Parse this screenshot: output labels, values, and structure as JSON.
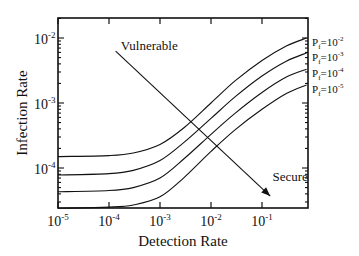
{
  "chart_data": {
    "type": "line",
    "title": "",
    "xlabel": "Detection Rate",
    "ylabel": "Infection Rate",
    "xscale": "log",
    "yscale": "log",
    "xlim": [
      1e-05,
      0.75
    ],
    "ylim": [
      2.4e-05,
      0.0135
    ],
    "grid": false,
    "x_ticks": [
      {
        "base": "10",
        "exp": "-5",
        "value": 1e-05
      },
      {
        "base": "10",
        "exp": "-4",
        "value": 0.0001
      },
      {
        "base": "10",
        "exp": "-3",
        "value": 0.001
      },
      {
        "base": "10",
        "exp": "-2",
        "value": 0.01
      },
      {
        "base": "10",
        "exp": "-1",
        "value": 0.1
      }
    ],
    "y_ticks": [
      {
        "base": "10",
        "exp": "-2",
        "value": 0.01
      },
      {
        "base": "10",
        "exp": "-3",
        "value": 0.001
      },
      {
        "base": "10",
        "exp": "-4",
        "value": 0.0001
      }
    ],
    "x": [
      1e-05,
      0.0001,
      0.0003,
      0.001,
      0.003,
      0.01,
      0.03,
      0.1,
      0.3,
      0.75
    ],
    "series": [
      {
        "name": "Pf=10^-2",
        "label_base": "P",
        "label_sub": "f",
        "label_eq": "=10",
        "label_exp": "-2",
        "values": [
          0.00015,
          0.000155,
          0.00017,
          0.00023,
          0.00042,
          0.001,
          0.0022,
          0.0045,
          0.0075,
          0.01
        ]
      },
      {
        "name": "Pf=10^-3",
        "label_base": "P",
        "label_sub": "f",
        "label_eq": "=10",
        "label_exp": "-3",
        "values": [
          7.8e-05,
          8.2e-05,
          9.2e-05,
          0.00013,
          0.00025,
          0.00058,
          0.00125,
          0.0026,
          0.0044,
          0.0059
        ]
      },
      {
        "name": "Pf=10^-4",
        "label_base": "P",
        "label_sub": "f",
        "label_eq": "=10",
        "label_exp": "-4",
        "values": [
          4.3e-05,
          4.5e-05,
          5e-05,
          7e-05,
          0.00014,
          0.00033,
          0.0007,
          0.00145,
          0.0025,
          0.0033
        ]
      },
      {
        "name": "Pf=10^-5",
        "label_base": "P",
        "label_sub": "f",
        "label_eq": "=10",
        "label_exp": "-5",
        "values": [
          2.4e-05,
          2.5e-05,
          2.7e-05,
          3.6e-05,
          7.2e-05,
          0.00018,
          0.00039,
          0.0008,
          0.0014,
          0.0019
        ]
      }
    ],
    "annotations": [
      {
        "text": "Vulnerable",
        "x": 0.00017,
        "y": 0.0065
      },
      {
        "text": "Secure",
        "x": 0.16,
        "y": 6.3e-05
      },
      {
        "type": "arrow",
        "from": [
          0.000135,
          0.0063
        ],
        "to": [
          0.145,
          3.7e-05
        ]
      }
    ],
    "legend": "inline-right"
  }
}
